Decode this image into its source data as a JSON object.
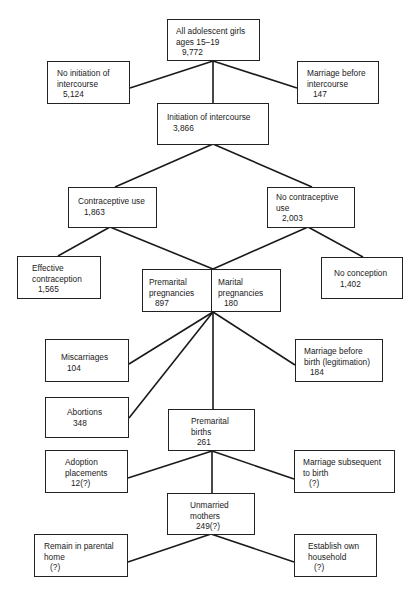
{
  "diagram": {
    "type": "flowchart",
    "nodes": {
      "all_girls": {
        "label": "All adolescent girls\nages 15–19",
        "value": "9,772"
      },
      "no_initiation": {
        "label": "No initiation of\nintercourse",
        "value": "5,124"
      },
      "marriage_before_intercourse": {
        "label": "Marriage before\nintercourse",
        "value": "147"
      },
      "initiation": {
        "label": "Initiation of intercourse",
        "value": "3,866"
      },
      "contraceptive_use": {
        "label": "Contraceptive use",
        "value": "1,863"
      },
      "no_contraceptive_use": {
        "label": "No contraceptive\nuse",
        "value": "2,003"
      },
      "effective_contraception": {
        "label": "Effective\ncontraception",
        "value": "1,565"
      },
      "premarital_pregnancies": {
        "label": "Premarital\npregnancies",
        "value": "897"
      },
      "marital_pregnancies": {
        "label": "Marital\npregnancies",
        "value": "180"
      },
      "no_conception": {
        "label": "No conception",
        "value": "1,402"
      },
      "miscarriages": {
        "label": "Miscarriages",
        "value": "104"
      },
      "abortions": {
        "label": "Abortions",
        "value": "348"
      },
      "marriage_before_birth": {
        "label": "Marriage before\nbirth (legitimation)",
        "value": "184"
      },
      "premarital_births": {
        "label": "Premarital\nbirths",
        "value": "261"
      },
      "adoption": {
        "label": "Adoption\nplacements",
        "value": "12(?)"
      },
      "marriage_subsequent": {
        "label": "Marriage subsequent\nto birth",
        "value": "(?)"
      },
      "unmarried_mothers": {
        "label": "Unmarried\nmothers",
        "value": "249(?)"
      },
      "remain_parental": {
        "label": "Remain in parental\nhome",
        "value": "(?)"
      },
      "establish_household": {
        "label": "Establish own\nhousehold",
        "value": "(?)"
      }
    },
    "edges": [
      [
        "all_girls",
        "no_initiation"
      ],
      [
        "all_girls",
        "marriage_before_intercourse"
      ],
      [
        "all_girls",
        "initiation"
      ],
      [
        "initiation",
        "contraceptive_use"
      ],
      [
        "initiation",
        "no_contraceptive_use"
      ],
      [
        "contraceptive_use",
        "effective_contraception"
      ],
      [
        "contraceptive_use",
        "pregnancies"
      ],
      [
        "no_contraceptive_use",
        "pregnancies"
      ],
      [
        "no_contraceptive_use",
        "no_conception"
      ],
      [
        "pregnancies",
        "miscarriages"
      ],
      [
        "pregnancies",
        "abortions"
      ],
      [
        "pregnancies",
        "premarital_births"
      ],
      [
        "pregnancies",
        "marriage_before_birth"
      ],
      [
        "premarital_births",
        "adoption"
      ],
      [
        "premarital_births",
        "unmarried_mothers"
      ],
      [
        "premarital_births",
        "marriage_subsequent"
      ],
      [
        "unmarried_mothers",
        "remain_parental"
      ],
      [
        "unmarried_mothers",
        "establish_household"
      ]
    ]
  }
}
